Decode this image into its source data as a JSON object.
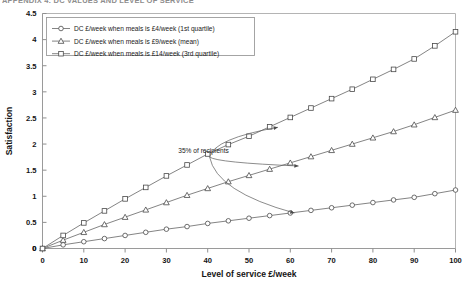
{
  "page": {
    "clipped_heading": "APPENDIX 4: DC VALUES AND LEVEL OF SERVICE"
  },
  "chart_data": {
    "type": "line",
    "title": "",
    "subtitle": "",
    "xlabel": "Level of service £/week",
    "ylabel": "Satisfaction",
    "xlim": [
      0,
      100
    ],
    "ylim": [
      0,
      4.5
    ],
    "xticks": [
      "0",
      "10",
      "20",
      "30",
      "40",
      "50",
      "60",
      "70",
      "80",
      "90",
      "100"
    ],
    "yticks": [
      "0",
      "0.5",
      "1",
      "1.5",
      "2",
      "2.5",
      "3",
      "3.5",
      "4",
      "4.5"
    ],
    "grid": false,
    "legend_position": "top-left",
    "x": [
      0,
      5,
      10,
      15,
      20,
      25,
      30,
      35,
      40,
      45,
      50,
      55,
      60,
      65,
      70,
      75,
      80,
      85,
      90,
      95,
      100
    ],
    "series": [
      {
        "name": "DC £/week when meals is £4/week (1st quartile)",
        "marker": "circle",
        "values": [
          0,
          0.07,
          0.13,
          0.19,
          0.25,
          0.31,
          0.37,
          0.42,
          0.48,
          0.53,
          0.58,
          0.63,
          0.68,
          0.73,
          0.78,
          0.83,
          0.88,
          0.93,
          0.98,
          1.05,
          1.12
        ]
      },
      {
        "name": "DC £/week when meals is £9/week (mean)",
        "marker": "triangle",
        "values": [
          0,
          0.16,
          0.31,
          0.46,
          0.6,
          0.74,
          0.88,
          1.02,
          1.15,
          1.28,
          1.4,
          1.52,
          1.64,
          1.76,
          1.88,
          2.0,
          2.12,
          2.24,
          2.37,
          2.51,
          2.65
        ]
      },
      {
        "name": "DC £/week when meals is £14/week (3rd quartile)",
        "marker": "square",
        "values": [
          0,
          0.25,
          0.49,
          0.72,
          0.95,
          1.17,
          1.39,
          1.6,
          1.81,
          1.99,
          2.15,
          2.33,
          2.51,
          2.69,
          2.87,
          3.05,
          3.24,
          3.43,
          3.63,
          3.88,
          4.15
        ]
      }
    ],
    "annotations": [
      {
        "text": "35% of recipients",
        "x": 39,
        "y": 1.82,
        "targets": [
          {
            "x": 57,
            "y": 2.32
          },
          {
            "x": 62,
            "y": 1.58
          },
          {
            "x": 61,
            "y": 0.68
          }
        ]
      }
    ]
  }
}
